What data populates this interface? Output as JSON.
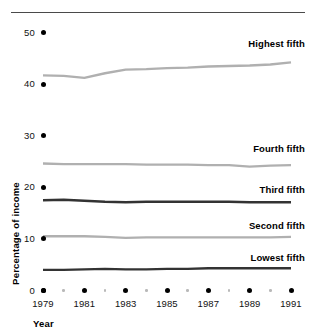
{
  "chart_data": {
    "type": "line",
    "title": "",
    "xlabel": "Year",
    "ylabel": "Percentage of income",
    "x": [
      1979,
      1980,
      1981,
      1982,
      1983,
      1984,
      1985,
      1986,
      1987,
      1988,
      1989,
      1990,
      1991
    ],
    "xlim": [
      1979,
      1991
    ],
    "ylim": [
      0,
      50
    ],
    "yticks": [
      0,
      10,
      20,
      30,
      40,
      50
    ],
    "ytick_labels": [
      "0",
      "10",
      "20",
      "30",
      "40",
      "50"
    ],
    "xticks": [
      1979,
      1981,
      1983,
      1985,
      1987,
      1989,
      1991
    ],
    "xtick_labels": [
      "1979",
      "1981",
      "1983",
      "1985",
      "1987",
      "1989",
      "1991"
    ],
    "xticks_minor": [
      1980,
      1982,
      1984,
      1986,
      1988,
      1990
    ],
    "grid": false,
    "legend_position": "inline-right",
    "series": [
      {
        "name": "Highest fifth",
        "color": "#b0b0b0",
        "width": 2.4,
        "values": [
          41.7,
          41.6,
          41.2,
          42.1,
          42.8,
          42.9,
          43.1,
          43.2,
          43.4,
          43.5,
          43.6,
          43.8,
          44.2
        ],
        "label_x": 1991,
        "label_y": 47.7
      },
      {
        "name": "Fourth fifth",
        "color": "#b0b0b0",
        "width": 2.4,
        "values": [
          24.6,
          24.5,
          24.5,
          24.5,
          24.5,
          24.4,
          24.4,
          24.4,
          24.3,
          24.3,
          24.0,
          24.2,
          24.3
        ],
        "label_x": 1991,
        "label_y": 27.5
      },
      {
        "name": "Third fifth",
        "color": "#333333",
        "width": 2.4,
        "values": [
          17.5,
          17.6,
          17.4,
          17.2,
          17.1,
          17.2,
          17.2,
          17.2,
          17.2,
          17.2,
          17.1,
          17.1,
          17.1
        ],
        "label_x": 1991,
        "label_y": 19.5
      },
      {
        "name": "Second fifth",
        "color": "#b0b0b0",
        "width": 2.4,
        "values": [
          10.5,
          10.5,
          10.5,
          10.4,
          10.2,
          10.3,
          10.3,
          10.3,
          10.3,
          10.3,
          10.3,
          10.3,
          10.4
        ],
        "label_x": 1991,
        "label_y": 12.5
      },
      {
        "name": "Lowest fifth",
        "color": "#333333",
        "width": 2.4,
        "values": [
          4.0,
          4.0,
          4.1,
          4.2,
          4.1,
          4.1,
          4.2,
          4.2,
          4.3,
          4.3,
          4.3,
          4.3,
          4.3
        ],
        "label_x": 1991,
        "label_y": 6.3
      }
    ]
  }
}
